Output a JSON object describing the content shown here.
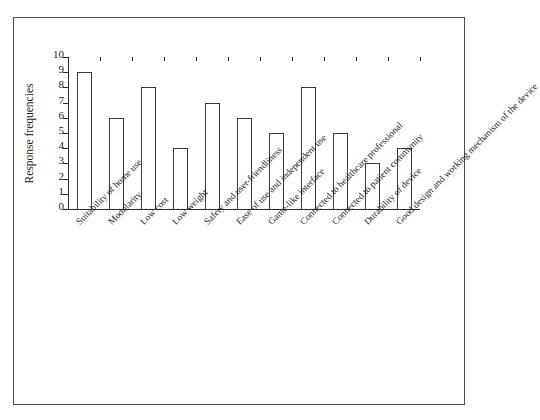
{
  "chart_data": {
    "type": "bar",
    "title": "",
    "subtitle": "",
    "xlabel": "",
    "ylabel": "Response frequencies",
    "ylim": [
      0,
      10
    ],
    "ytick_labels": [
      "0",
      "1",
      "2",
      "3",
      "4",
      "5",
      "6",
      "7",
      "8",
      "9",
      "10"
    ],
    "ytick_values": [
      0,
      1,
      2,
      3,
      4,
      5,
      6,
      7,
      8,
      9,
      10
    ],
    "grid": false,
    "legend": false,
    "legend_position": "none",
    "bar_face_color": "#ffffff",
    "bar_edge_color": "#3a3a3a",
    "axis_color": "#2b2b2b",
    "frame_color": "#4a4a4a",
    "background_color": "#ffffff",
    "categories": [
      "Suitability of home use",
      "Modularity",
      "Low cost",
      "Low weight",
      "Safety and user-friendliness",
      "Ease of use and independent use",
      "Game-like interface",
      "Connected to healthcare professional",
      "Connected to patient community",
      "Durability of device",
      "Good design and working mechanism of the device"
    ],
    "values": [
      9,
      6,
      8,
      4,
      7,
      6,
      5,
      8,
      5,
      3,
      4
    ]
  }
}
